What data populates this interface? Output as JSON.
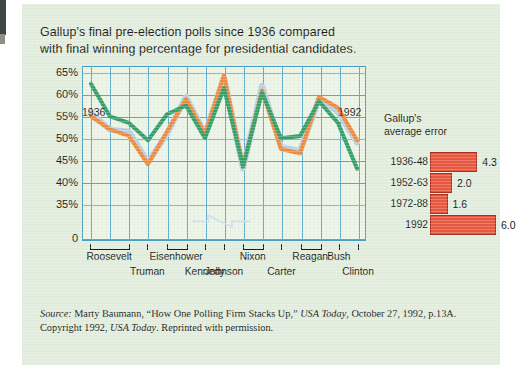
{
  "figure": {
    "title_line1": "Gallup's final pre-election polls since 1936 compared",
    "title_line2": "with final winning percentage for presidential candidates.",
    "paper_color": "#e2eedd",
    "grid_color": "#5aa9cd",
    "plot_bg": "#eaf3e4"
  },
  "source": {
    "label": "Source:",
    "text_a": " Marty Baumann, ",
    "article": "“How One Polling Firm Stacks Up,”",
    "text_b": " ",
    "publication": "USA Today",
    "text_c": ", October 27, 1992, p.13A.",
    "line2_a": "Copyright 1992, ",
    "line2_pub": "USA Today",
    "line2_b": ". Reprinted with permission."
  },
  "error_panel": {
    "title_line1": "Gallup's",
    "title_line2": "average error",
    "bar_color": "#e8573f",
    "rows": [
      {
        "label": "1936-48",
        "value": "4.3",
        "v": 4.3
      },
      {
        "label": "1952-63",
        "value": "2.0",
        "v": 2.0
      },
      {
        "label": "1972-88",
        "value": "1.6",
        "v": 1.6
      },
      {
        "label": "1992",
        "value": "6.0",
        "v": 6.0
      }
    ]
  },
  "axis": {
    "start_year": "1936",
    "end_year": "1992",
    "y_ticks": [
      "65%",
      "60%",
      "55%",
      "50%",
      "45%",
      "40%",
      "35%",
      "0"
    ],
    "presidents_row1": [
      "Roosevelt",
      "Eisenhower",
      "Nixon",
      "Reagan",
      "Bush"
    ],
    "presidents_row2": [
      "Truman",
      "Kennedy",
      "Johnson",
      "Carter",
      "Clinton"
    ]
  },
  "chart_data": {
    "type": "line",
    "title": "Gallup's final pre-election polls since 1936 compared with final winning percentage for presidential candidates.",
    "xlabel": "",
    "ylabel": "Percentage",
    "ylim": [
      35,
      65
    ],
    "grid": true,
    "legend": "none",
    "note": "Y axis is broken between 0 and 35%; values below 35% are not shown.",
    "x": [
      "1936",
      "1940",
      "1944",
      "1948",
      "1952",
      "1956",
      "1960",
      "1964",
      "1968",
      "1972",
      "1976",
      "1980",
      "1984",
      "1988",
      "1992"
    ],
    "series": [
      {
        "name": "Gallup final poll",
        "color": "#b9cfe2",
        "values": [
          55.7,
          52.0,
          51.5,
          44.5,
          51.0,
          59.5,
          51.0,
          64.0,
          43.0,
          62.0,
          48.0,
          47.0,
          59.0,
          56.0,
          49.0
        ]
      },
      {
        "name": "Actual winning percentage",
        "color": "#34a06a",
        "values": [
          62.5,
          55.0,
          53.5,
          49.5,
          55.5,
          57.5,
          50.0,
          61.5,
          43.5,
          60.5,
          50.0,
          50.5,
          58.5,
          53.5,
          43.0
        ]
      },
      {
        "name": "Alternate poll estimate",
        "color": "#f08a3c",
        "values": [
          55.0,
          52.0,
          50.5,
          44.0,
          51.5,
          59.0,
          51.0,
          64.5,
          43.5,
          61.0,
          47.5,
          46.5,
          59.5,
          57.0,
          49.5
        ]
      }
    ],
    "secondary": {
      "type": "bar",
      "orientation": "horizontal",
      "title": "Gallup's average error",
      "categories": [
        "1936-48",
        "1952-63",
        "1972-88",
        "1992"
      ],
      "values": [
        4.3,
        2.0,
        1.6,
        6.0
      ],
      "color": "#e8573f"
    }
  }
}
